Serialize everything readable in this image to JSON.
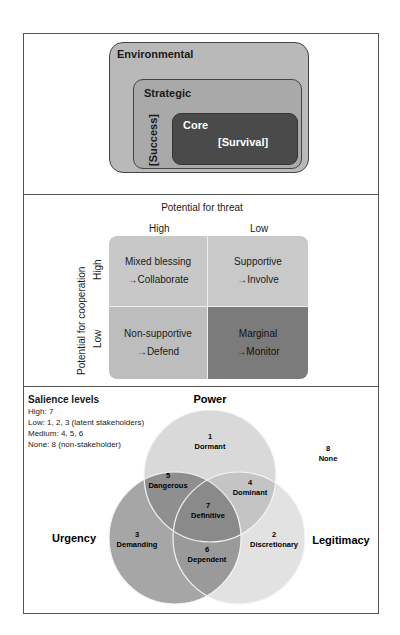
{
  "panel1": {
    "environmental": "Environmental",
    "strategic": "Strategic",
    "success": "[Success]",
    "core": "Core",
    "survival": "[Survival]"
  },
  "panel2": {
    "threat_title": "Potential for threat",
    "threat_high": "High",
    "threat_low": "Low",
    "coop_title": "Potential for cooperation",
    "coop_high": "High",
    "coop_low": "Low",
    "cells": [
      {
        "name": "Mixed blessing",
        "action": "→Collaborate"
      },
      {
        "name": "Supportive",
        "action": "→Involve"
      },
      {
        "name": "Non-supportive",
        "action": "→Defend"
      },
      {
        "name": "Marginal",
        "action": "→Monitor"
      }
    ]
  },
  "panel3": {
    "salience_title": "Salience levels",
    "salience_lines": [
      "High: 7",
      "Low: 1, 2, 3 (latent stakeholders)",
      "Medium: 4, 5, 6",
      "None: 8 (non-stakeholder)"
    ],
    "circles": {
      "power": "Power",
      "urgency": "Urgency",
      "legitimacy": "Legitimacy"
    },
    "regions": [
      {
        "num": "1",
        "name": "Dormant"
      },
      {
        "num": "2",
        "name": "Discretionary"
      },
      {
        "num": "3",
        "name": "Demanding"
      },
      {
        "num": "4",
        "name": "Dominant"
      },
      {
        "num": "5",
        "name": "Dangerous"
      },
      {
        "num": "6",
        "name": "Dependent"
      },
      {
        "num": "7",
        "name": "Definitive"
      },
      {
        "num": "8",
        "name": "None"
      }
    ],
    "colors": {
      "power": "#d9d9d9",
      "urgency": "#a6a6a6",
      "legitimacy": "#e2e2e2",
      "power_urgency": "#8f8f8f",
      "power_legitimacy": "#c4c4c4",
      "urgency_legitimacy": "#9a9a9a",
      "all": "#8a8a8a"
    }
  }
}
